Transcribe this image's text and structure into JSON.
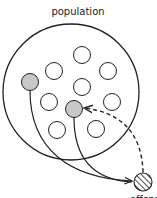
{
  "diagram": {
    "title": "population",
    "offspring_label": "offspring",
    "colors": {
      "stroke": "#222222",
      "selected_fill": "#c8c8c8",
      "background": "#ffffff"
    },
    "population_circle": {
      "cx": 71,
      "cy": 92,
      "r": 68
    },
    "individuals": [
      {
        "cx": 82,
        "cy": 55,
        "selected": false
      },
      {
        "cx": 54,
        "cy": 71,
        "selected": false
      },
      {
        "cx": 108,
        "cy": 71,
        "selected": false
      },
      {
        "cx": 30,
        "cy": 82,
        "selected": true
      },
      {
        "cx": 82,
        "cy": 87,
        "selected": false
      },
      {
        "cx": 49,
        "cy": 102,
        "selected": false
      },
      {
        "cx": 112,
        "cy": 102,
        "selected": false
      },
      {
        "cx": 74,
        "cy": 109,
        "selected": true
      },
      {
        "cx": 57,
        "cy": 130,
        "selected": false
      },
      {
        "cx": 96,
        "cy": 129,
        "selected": false
      }
    ],
    "offspring": {
      "cx": 143,
      "cy": 182,
      "r": 9,
      "pattern": "hatched"
    },
    "edges": [
      {
        "from": "parent-1",
        "to": "offspring",
        "style": "solid"
      },
      {
        "from": "parent-2",
        "to": "offspring",
        "style": "solid"
      },
      {
        "from": "offspring",
        "to": "population",
        "style": "dashed"
      }
    ]
  }
}
